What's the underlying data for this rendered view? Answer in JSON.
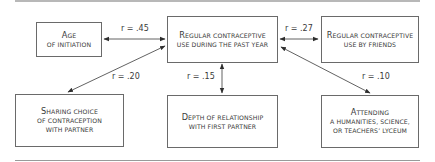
{
  "diagram": {
    "nodes": {
      "center": {
        "lines": [
          "Regular contraceptive",
          "use during the past year"
        ]
      },
      "age": {
        "lines": [
          "Age",
          "of initiation"
        ]
      },
      "friends": {
        "lines": [
          "Regular contraceptive",
          "use by friends"
        ]
      },
      "sharing": {
        "lines": [
          "Sharing choice",
          "of contraception",
          "with partner"
        ]
      },
      "depth": {
        "lines": [
          "Depth of relationship",
          "with first partner"
        ]
      },
      "lyceum": {
        "lines": [
          "Attending",
          "a humanities, science,",
          "or teachers’ lyceum"
        ]
      }
    },
    "edges": [
      {
        "from": "age",
        "to": "center",
        "label": "r = .45",
        "type": "bidirectional"
      },
      {
        "from": "center",
        "to": "friends",
        "label": "r = .27",
        "type": "bidirectional"
      },
      {
        "from": "sharing",
        "to": "center",
        "label": "r = .20",
        "type": "bidirectional"
      },
      {
        "from": "depth",
        "to": "center",
        "label": "r = .15",
        "type": "bidirectional"
      },
      {
        "from": "lyceum",
        "to": "center",
        "label": "r = .10",
        "type": "bidirectional"
      }
    ],
    "colors": {
      "line": "#3a3a3a",
      "border": "#6a6a6a",
      "rule": "#b8b8b8"
    }
  }
}
